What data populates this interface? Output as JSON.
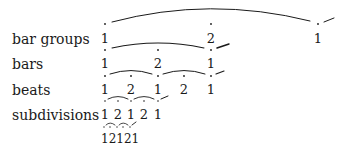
{
  "rows": [
    {
      "label": "bar groups",
      "values": [
        "1",
        "2",
        "1"
      ]
    },
    {
      "label": "bars",
      "values": [
        "1",
        "2",
        "1"
      ]
    },
    {
      "label": "beats",
      "values": [
        "1",
        "2",
        "1",
        "2",
        "1"
      ]
    },
    {
      "label": "subdivisions",
      "values": [
        "1",
        "2",
        "1",
        "2",
        "1"
      ]
    }
  ],
  "bottom_sequence": "12121",
  "colors": {
    "ink": "#1a1a1a",
    "background": "#ffffff"
  }
}
